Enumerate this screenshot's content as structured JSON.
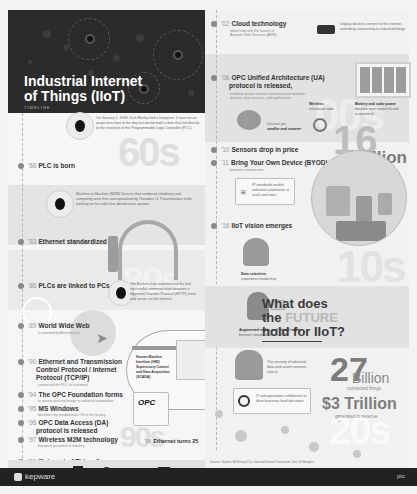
{
  "hero": {
    "title_line1": "Industrial Internet",
    "title_line2": "of Things (IIoT)",
    "subtitle": "TIMELINE"
  },
  "left_timeline": {
    "intro_note": "On January 2, 1968, Dick Morley had a hangover. It was not an auspicious start to the day but would mark a date that led directly to the invention of the Programmable Logic Controller (PLC).",
    "items": [
      {
        "year": "'68",
        "label": "PLC is born"
      },
      {
        "year": "'83",
        "label": "Ethernet standardized"
      },
      {
        "year": "'86",
        "label": "PLCs are linked to PCs"
      },
      {
        "year": "'89",
        "label": "World Wide Web",
        "sub": "is invented by Berners-Lee"
      },
      {
        "year": "'90",
        "label": "Ethernet and Transmission",
        "label2": "Control Protocol / Internet",
        "label3": "Protocol (TCP/IP)",
        "sub": "connected the PLC to a terminal"
      },
      {
        "year": "'94",
        "label": "The OPC Foundation forms",
        "sub": "to ensure data exchange in industrial automation"
      },
      {
        "year": "'95",
        "label": "MS Windows",
        "sub": "becomes the predominant OS in the factory"
      },
      {
        "year": "'96",
        "label": "OPC Data Access (DA)",
        "label2": "protocol is released"
      },
      {
        "year": "'97",
        "label": "Wireless M2M technology",
        "sub": "becomes prevalent in industry"
      },
      {
        "year": "'99",
        "label": "\"Internet of Things\"",
        "sub": "is coined by Kevin Ashton"
      }
    ],
    "note_1980s": "Machine-to-Machine (M2M) Devices that combined telephony and computing were first conceptualized by Theodore G. Paraskevakos while working on his caller line identification system.",
    "note_1989": "Tim Berners-Lee implemented the first successful communication between a Hypertext Transfer Protocol (HTTP) client and server via the internet.",
    "hmi_box": {
      "line1": "Human-Machine",
      "line2": "Interface (HMI)",
      "line3": "Supervisory Control",
      "line4": "and Data Acquisition",
      "line5": "(SCADA)"
    },
    "opc_box": {
      "logo": "OPC",
      "caption": "The OPC Foundation logo"
    },
    "ethernet_25": {
      "year": "'98",
      "label": "Ethernet turns 25",
      "sub": "and becomes integrated in industrial automation"
    },
    "decades": {
      "d60s": "60s",
      "d80s": "80s",
      "d90s": "90s"
    }
  },
  "right_timeline": {
    "items": [
      {
        "year": "'02",
        "label": "Cloud technology",
        "sub": "takes hold with the launch of Amazon Web Services (AWS)"
      },
      {
        "year": "'06",
        "label": "OPC Unified Architecture (UA)",
        "label2": "protocol is released,",
        "sub": "enabling secure remote communication between devices, data sources, and applications"
      },
      {
        "year": "'10",
        "label": "Sensors drop in price"
      },
      {
        "year": "'11",
        "label": "Bring Your Own Device (BYOD)",
        "sub": "becomes mainstream"
      },
      {
        "year": "'16",
        "label": "IIoT vision emerges"
      }
    ],
    "legacy_note": "Legacy devices connect to the internet, extending connectivity to industrial things",
    "features": {
      "wireless": "Wireless",
      "wireless_sub": "enhanced radio",
      "battery": "Battery and solar power",
      "battery_sub": "become more powerful and economical",
      "devices": "Devices get",
      "devices_sub": "smaller and smarter"
    },
    "ip_box": "IP standards enable industrial automation at scale and rates",
    "data_scientists": "Data scientists",
    "data_scientists_sub": "experience leadership",
    "ar_vr": "Augmented reality and virtual reality",
    "ar_vr_sub": "become standard fare for IIoT",
    "security": "The security of industrial data and assets remains critical",
    "it_ot": "IT and operations collaborate to drive business-level decisions",
    "decades": {
      "d00s": "00s",
      "d10s": "10s",
      "d20s": "20s"
    }
  },
  "stats": {
    "billion16_num": "16",
    "billion16_word": "Billion",
    "billion16_cap": "connected things",
    "billion27_num": "27",
    "billion27_word": "Billion",
    "billion27_cap": "connected things",
    "trillion": "$3 Trillion",
    "trillion_cap": "generated in revenue"
  },
  "future": {
    "line1": "What does",
    "line2_pre": "the ",
    "line2_hl": "FUTURE",
    "line3": "hold for IIoT?"
  },
  "footer": {
    "brand": "kepware",
    "partner": "ptc",
    "citation": "Sources: Gartner, McKinsey & Co, Industrial Internet Consortium, Intel, IoT Analytics"
  }
}
